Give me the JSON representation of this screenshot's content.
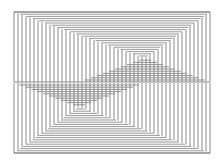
{
  "artwork": {
    "title": "Op-art line pattern",
    "frame": {
      "left": 14,
      "top": 12,
      "right": 210,
      "bottom": 153,
      "middle": 82
    },
    "top_apex": {
      "x": 145,
      "y": 58
    },
    "bottom_apex": {
      "x": 78,
      "y": 108
    },
    "vertical_spacing": 4,
    "horizontal_spacing": 2.2,
    "stroke_color": "#6e6e6e",
    "background": "#ffffff"
  }
}
